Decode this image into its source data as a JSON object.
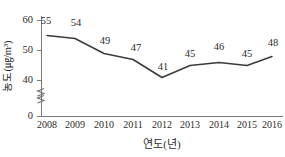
{
  "chart_data": {
    "type": "line",
    "title": "",
    "xlabel": "연도(년)",
    "ylabel": "농도(㎍/m³)",
    "categories": [
      "2008",
      "2009",
      "2010",
      "2011",
      "2012",
      "2013",
      "2014",
      "2015",
      "2016"
    ],
    "values": [
      55,
      54,
      49,
      47,
      41,
      45,
      46,
      45,
      48
    ],
    "series": [
      {
        "name": "농도",
        "values": [
          55,
          54,
          49,
          47,
          41,
          45,
          46,
          45,
          48
        ],
        "color": "#3a3a3a"
      }
    ],
    "point_labels": [
      "55",
      "54",
      "49",
      "47",
      "41",
      "45",
      "46",
      "45",
      "48"
    ],
    "ylim": [
      36,
      62
    ],
    "yticks": [
      0,
      40,
      50,
      60
    ],
    "ytick_labels": [
      "0",
      "40",
      "50",
      "60"
    ],
    "axis_break": true,
    "axis_break_symbol": "≈",
    "grid": false,
    "legend": false,
    "markers": false,
    "line_color": "#3a3a3a",
    "axis_color": "#7a7a7a",
    "background": "#ffffff"
  },
  "yaxis": {
    "title": "농도(㎍/m³)",
    "ticks": [
      {
        "label": "60",
        "value": 60
      },
      {
        "label": "50",
        "value": 50
      },
      {
        "label": "40",
        "value": 40
      },
      {
        "label": "0",
        "value": 0
      }
    ]
  },
  "xaxis": {
    "title": "연도(년)",
    "ticks": [
      "2008",
      "2009",
      "2010",
      "2011",
      "2012",
      "2013",
      "2014",
      "2015",
      "2016"
    ]
  }
}
